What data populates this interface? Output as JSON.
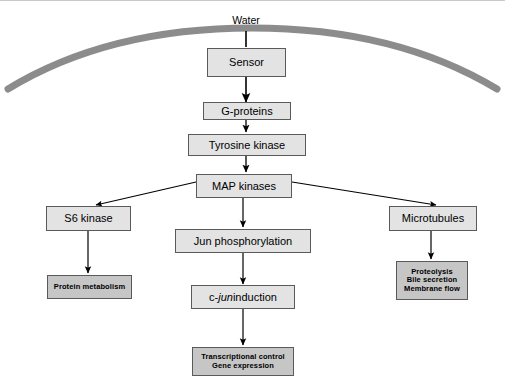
{
  "diagram": {
    "colors": {
      "box_fill": "#e3e3e3",
      "terminal_fill": "#c6c6c6",
      "border": "#5a5a5a",
      "membrane": "#8c8c8c",
      "arrow": "#000000",
      "page_border": "#c9c9c9"
    },
    "membrane": {
      "name": "cell-membrane-arc",
      "label": ""
    },
    "input_label": "Water",
    "nodes": [
      {
        "id": "sensor",
        "label": "Sensor",
        "kind": "receptor"
      },
      {
        "id": "gproteins",
        "label": "G-proteins",
        "kind": "step"
      },
      {
        "id": "tyrosine",
        "label": "Tyrosine kinase",
        "kind": "step"
      },
      {
        "id": "mapkinases",
        "label": "MAP kinases",
        "kind": "hub"
      },
      {
        "id": "s6kinase",
        "label": "S6 kinase",
        "kind": "step"
      },
      {
        "id": "jun_phos",
        "label": "Jun phosphorylation",
        "kind": "step"
      },
      {
        "id": "microtubules",
        "label": "Microtubules",
        "kind": "step"
      },
      {
        "id": "protein_metab",
        "label": "Protein metabolism",
        "kind": "terminal"
      },
      {
        "id": "cjun",
        "label_pre": "c-",
        "label_italic": "jun",
        "label_post": " induction",
        "kind": "step"
      },
      {
        "id": "proteolysis",
        "label": "Proteolysis\nBile secretion\nMembrane flow",
        "kind": "terminal"
      },
      {
        "id": "transcription",
        "label": "Transcriptional control\nGene expression",
        "kind": "terminal"
      }
    ],
    "edges": [
      {
        "from": "water",
        "to": "sensor"
      },
      {
        "from": "sensor",
        "to": "gproteins"
      },
      {
        "from": "gproteins",
        "to": "tyrosine"
      },
      {
        "from": "tyrosine",
        "to": "mapkinases"
      },
      {
        "from": "mapkinases",
        "to": "s6kinase"
      },
      {
        "from": "mapkinases",
        "to": "jun_phos"
      },
      {
        "from": "mapkinases",
        "to": "microtubules"
      },
      {
        "from": "s6kinase",
        "to": "protein_metab"
      },
      {
        "from": "jun_phos",
        "to": "cjun"
      },
      {
        "from": "microtubules",
        "to": "proteolysis"
      },
      {
        "from": "cjun",
        "to": "transcription"
      }
    ]
  }
}
